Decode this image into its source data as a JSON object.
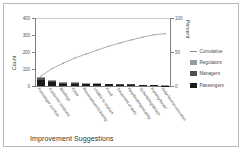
{
  "chart_data": {
    "type": "bar",
    "title": "",
    "xlabel": "Improvement Suggestions",
    "ylabel": "Count",
    "y2label": "Percent",
    "ylim": [
      0,
      400
    ],
    "y2lim": [
      0,
      100
    ],
    "yticks": [
      "0",
      "100",
      "200",
      "300",
      "400"
    ],
    "y2ticks": [
      "0",
      "50",
      "100"
    ],
    "grid": false,
    "legend_position": "right",
    "categories": [
      "Passenger comfort",
      "Customer relations",
      "Briefings",
      "Crew",
      "Reservations/ticketing",
      "Unable to explain",
      "Food",
      "Treatment of pets",
      "Overbooking/seating",
      "Scheduling/delays",
      "Parking/travel",
      "Duty-free/accessories"
    ],
    "series": [
      {
        "name": "Passengers",
        "color": "#1a1a1a",
        "values": [
          34,
          22,
          14,
          13,
          9,
          9,
          9,
          7,
          6,
          6,
          5,
          2
        ]
      },
      {
        "name": "Managers",
        "color": "#4f4f4f",
        "values": [
          14,
          9,
          6,
          6,
          4,
          4,
          3,
          3,
          3,
          2,
          2,
          1
        ]
      },
      {
        "name": "Regulators",
        "color": "#9a9a9a",
        "values": [
          8,
          5,
          4,
          3,
          2,
          2,
          2,
          2,
          1,
          1,
          1,
          1
        ]
      }
    ],
    "cumulative": {
      "name": "Cumulative",
      "color": "#8a8a8a",
      "percent": [
        14.5,
        25.5,
        33.5,
        41.0,
        47.0,
        52.8,
        58.4,
        63.3,
        67.8,
        71.8,
        75.4,
        77.0
      ]
    }
  },
  "legend": {
    "items": [
      {
        "name": "Cumulative",
        "kind": "line"
      },
      {
        "name": "Regulators",
        "kind": "swatch"
      },
      {
        "name": "Managers",
        "kind": "swatch"
      },
      {
        "name": "Passengers",
        "kind": "swatch"
      }
    ]
  }
}
